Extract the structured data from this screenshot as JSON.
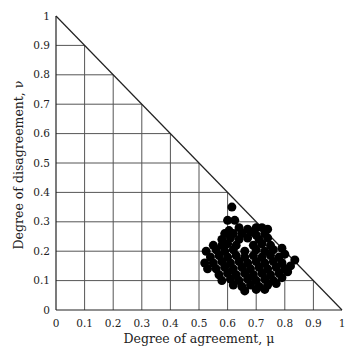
{
  "chart_data": {
    "type": "scatter",
    "title": "",
    "xlabel": "Degree of agreement, μ",
    "ylabel": "Degree of disagreement, ν",
    "xlim": [
      0,
      1
    ],
    "ylim": [
      0,
      1
    ],
    "x_ticks": [
      "0",
      "0.1",
      "0.2",
      "0.3",
      "0.4",
      "0.5",
      "0.6",
      "0.7",
      "0.8",
      "0.9",
      "1"
    ],
    "y_ticks": [
      "0",
      "0.1",
      "0.2",
      "0.3",
      "0.4",
      "0.5",
      "0.6",
      "0.7",
      "0.8",
      "0.9",
      "1"
    ],
    "grid": "triangular (only region mu + nu <= 1)",
    "boundary": "line mu + nu = 1",
    "legend": null,
    "marker": {
      "shape": "circle",
      "color": "#000000",
      "radius": 4.5
    },
    "series": [
      {
        "name": "points",
        "points": [
          [
            0.615,
            0.35
          ],
          [
            0.6,
            0.305
          ],
          [
            0.625,
            0.305
          ],
          [
            0.72,
            0.28
          ],
          [
            0.59,
            0.26
          ],
          [
            0.62,
            0.26
          ],
          [
            0.65,
            0.26
          ],
          [
            0.68,
            0.265
          ],
          [
            0.7,
            0.255
          ],
          [
            0.73,
            0.26
          ],
          [
            0.58,
            0.24
          ],
          [
            0.61,
            0.245
          ],
          [
            0.64,
            0.24
          ],
          [
            0.67,
            0.245
          ],
          [
            0.71,
            0.24
          ],
          [
            0.74,
            0.245
          ],
          [
            0.58,
            0.22
          ],
          [
            0.6,
            0.225
          ],
          [
            0.63,
            0.22
          ],
          [
            0.69,
            0.22
          ],
          [
            0.72,
            0.225
          ],
          [
            0.75,
            0.22
          ],
          [
            0.525,
            0.2
          ],
          [
            0.56,
            0.205
          ],
          [
            0.59,
            0.2
          ],
          [
            0.62,
            0.205
          ],
          [
            0.66,
            0.2
          ],
          [
            0.7,
            0.205
          ],
          [
            0.73,
            0.2
          ],
          [
            0.76,
            0.205
          ],
          [
            0.79,
            0.21
          ],
          [
            0.52,
            0.16
          ],
          [
            0.54,
            0.18
          ],
          [
            0.57,
            0.185
          ],
          [
            0.6,
            0.18
          ],
          [
            0.63,
            0.185
          ],
          [
            0.66,
            0.18
          ],
          [
            0.69,
            0.185
          ],
          [
            0.72,
            0.18
          ],
          [
            0.75,
            0.185
          ],
          [
            0.78,
            0.18
          ],
          [
            0.8,
            0.19
          ],
          [
            0.53,
            0.14
          ],
          [
            0.55,
            0.16
          ],
          [
            0.58,
            0.165
          ],
          [
            0.61,
            0.16
          ],
          [
            0.64,
            0.165
          ],
          [
            0.67,
            0.16
          ],
          [
            0.7,
            0.165
          ],
          [
            0.73,
            0.16
          ],
          [
            0.76,
            0.165
          ],
          [
            0.79,
            0.16
          ],
          [
            0.835,
            0.17
          ],
          [
            0.56,
            0.14
          ],
          [
            0.59,
            0.145
          ],
          [
            0.62,
            0.14
          ],
          [
            0.65,
            0.145
          ],
          [
            0.68,
            0.14
          ],
          [
            0.71,
            0.145
          ],
          [
            0.74,
            0.14
          ],
          [
            0.77,
            0.145
          ],
          [
            0.8,
            0.14
          ],
          [
            0.82,
            0.15
          ],
          [
            0.57,
            0.12
          ],
          [
            0.6,
            0.125
          ],
          [
            0.63,
            0.12
          ],
          [
            0.66,
            0.125
          ],
          [
            0.69,
            0.12
          ],
          [
            0.72,
            0.125
          ],
          [
            0.75,
            0.12
          ],
          [
            0.78,
            0.125
          ],
          [
            0.81,
            0.13
          ],
          [
            0.58,
            0.1
          ],
          [
            0.61,
            0.105
          ],
          [
            0.64,
            0.1
          ],
          [
            0.67,
            0.105
          ],
          [
            0.7,
            0.1
          ],
          [
            0.73,
            0.105
          ],
          [
            0.76,
            0.1
          ],
          [
            0.79,
            0.11
          ],
          [
            0.62,
            0.085
          ],
          [
            0.65,
            0.08
          ],
          [
            0.68,
            0.085
          ],
          [
            0.71,
            0.08
          ],
          [
            0.74,
            0.085
          ],
          [
            0.77,
            0.09
          ],
          [
            0.66,
            0.065
          ],
          [
            0.7,
            0.07
          ],
          [
            0.73,
            0.07
          ],
          [
            0.55,
            0.22
          ],
          [
            0.64,
            0.28
          ],
          [
            0.67,
            0.275
          ],
          [
            0.7,
            0.28
          ],
          [
            0.74,
            0.275
          ],
          [
            0.605,
            0.27
          ]
        ]
      }
    ]
  }
}
